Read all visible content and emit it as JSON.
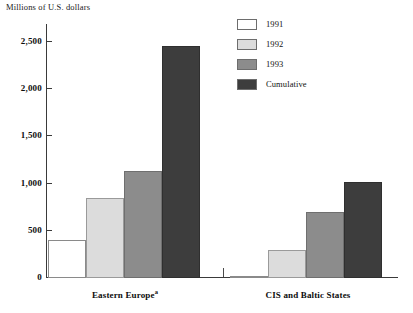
{
  "chart_data": {
    "type": "bar",
    "title": "Millions of U.S. dollars",
    "xlabel": "",
    "ylabel": "Millions of U.S. dollars",
    "ylim": [
      0,
      2500
    ],
    "yticks": [
      0,
      500,
      1000,
      1500,
      2000,
      2500
    ],
    "ytick_labels": [
      "0",
      "500",
      "1,000",
      "1,500",
      "2,000",
      "2,500"
    ],
    "grid": false,
    "legend_position": "top-right",
    "categories": [
      "Eastern Europe",
      "CIS and Baltic States"
    ],
    "category_labels": [
      "Eastern Europe",
      "CIS and Baltic States"
    ],
    "category_footnotes": [
      "a",
      ""
    ],
    "series": [
      {
        "name": "1991",
        "color": "#ffffff",
        "values": [
          400,
          20
        ]
      },
      {
        "name": "1992",
        "color": "#dcdcdc",
        "values": [
          850,
          300
        ]
      },
      {
        "name": "1993",
        "color": "#8c8c8c",
        "values": [
          1130,
          700
        ]
      },
      {
        "name": "Cumulative",
        "color": "#3d3d3d",
        "values": [
          2460,
          1020
        ]
      }
    ]
  },
  "legend": {
    "items": [
      {
        "label": "1991"
      },
      {
        "label": "1992"
      },
      {
        "label": "1993"
      },
      {
        "label": "Cumulative"
      }
    ]
  },
  "axis": {
    "title": "Millions of U.S. dollars",
    "ticks": [
      {
        "label": "2,500"
      },
      {
        "label": "2,000"
      },
      {
        "label": "1,500"
      },
      {
        "label": "1,000"
      },
      {
        "label": "500"
      },
      {
        "label": "0"
      }
    ]
  },
  "groups": [
    {
      "label": "Eastern Europe",
      "footnote": "a"
    },
    {
      "label": "CIS and Baltic States",
      "footnote": ""
    }
  ]
}
